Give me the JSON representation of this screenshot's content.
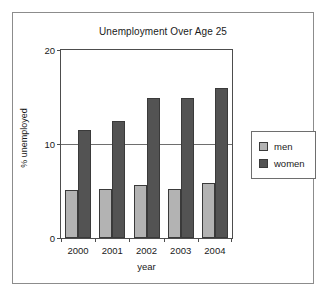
{
  "chart_data": {
    "type": "bar",
    "title": "Unemployment Over Age 25",
    "xlabel": "year",
    "ylabel": "% unemployed",
    "categories": [
      "2000",
      "2001",
      "2002",
      "2003",
      "2004"
    ],
    "series": [
      {
        "name": "men",
        "values": [
          5.1,
          5.2,
          5.6,
          5.2,
          5.8
        ],
        "color": "#b3b3b3"
      },
      {
        "name": "women",
        "values": [
          11.5,
          12.5,
          14.9,
          14.9,
          16.0
        ],
        "color": "#535353"
      }
    ],
    "ylim": [
      0,
      20
    ],
    "yticks": [
      0,
      10,
      20
    ],
    "ytick_labels": [
      "0",
      "10",
      "20"
    ],
    "grid": true,
    "legend_position": "right"
  },
  "legend": {
    "entries": [
      {
        "label": "men"
      },
      {
        "label": "women"
      }
    ]
  }
}
